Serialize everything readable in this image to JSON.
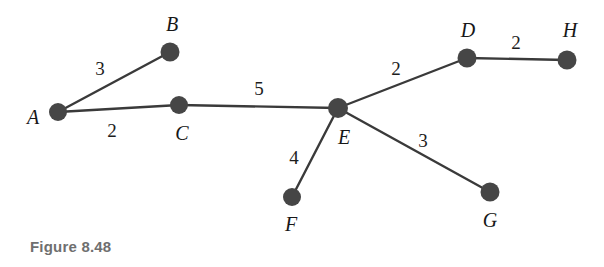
{
  "figure": {
    "caption": "Figure 8.48",
    "caption_color": "#6f6f6f",
    "background_color": "#ffffff",
    "node_color": "#464646",
    "edge_color": "#3a3a3a"
  },
  "graph": {
    "type": "weighted-undirected-graph",
    "nodes": [
      {
        "id": "A",
        "label": "A",
        "cx": 58,
        "cy": 112,
        "r": 9,
        "label_x": 33,
        "label_y": 117
      },
      {
        "id": "B",
        "label": "B",
        "cx": 170,
        "cy": 52,
        "r": 9.5,
        "label_x": 172,
        "label_y": 24
      },
      {
        "id": "C",
        "label": "C",
        "cx": 179,
        "cy": 105,
        "r": 9,
        "label_x": 182,
        "label_y": 133
      },
      {
        "id": "D",
        "label": "D",
        "cx": 467,
        "cy": 58,
        "r": 9.5,
        "label_x": 468,
        "label_y": 30
      },
      {
        "id": "E",
        "label": "E",
        "cx": 338,
        "cy": 108,
        "r": 10,
        "label_x": 344,
        "label_y": 137
      },
      {
        "id": "F",
        "label": "F",
        "cx": 292,
        "cy": 197,
        "r": 9,
        "label_x": 291,
        "label_y": 224
      },
      {
        "id": "G",
        "label": "G",
        "cx": 490,
        "cy": 192,
        "r": 9.5,
        "label_x": 490,
        "label_y": 220
      },
      {
        "id": "H",
        "label": "H",
        "cx": 567,
        "cy": 60,
        "r": 9.5,
        "label_x": 570,
        "label_y": 30
      }
    ],
    "edges": [
      {
        "from": "A",
        "to": "B",
        "weight": "3",
        "label_x": 100,
        "label_y": 68
      },
      {
        "from": "A",
        "to": "C",
        "weight": "2",
        "label_x": 112,
        "label_y": 130
      },
      {
        "from": "C",
        "to": "E",
        "weight": "5",
        "label_x": 259,
        "label_y": 88
      },
      {
        "from": "E",
        "to": "D",
        "weight": "2",
        "label_x": 396,
        "label_y": 68
      },
      {
        "from": "D",
        "to": "H",
        "weight": "2",
        "label_x": 516,
        "label_y": 42
      },
      {
        "from": "E",
        "to": "F",
        "weight": "4",
        "label_x": 294,
        "label_y": 157
      },
      {
        "from": "E",
        "to": "G",
        "weight": "3",
        "label_x": 423,
        "label_y": 140
      }
    ]
  }
}
